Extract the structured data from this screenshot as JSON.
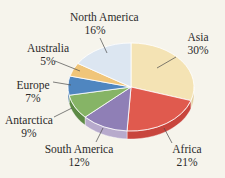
{
  "chart_data": {
    "type": "pie",
    "title": "",
    "style": "3d-tilted",
    "start_angle_deg": 0,
    "direction": "clockwise",
    "slices": [
      {
        "label": "Asia",
        "value": 30,
        "pct_text": "30%",
        "color": "#f4e3b4",
        "side": "#e2cf9c"
      },
      {
        "label": "Africa",
        "value": 21,
        "pct_text": "21%",
        "color": "#e05a4e",
        "side": "#c8453d"
      },
      {
        "label": "South America",
        "value": 12,
        "pct_text": "12%",
        "color": "#8f7fb6",
        "side": "#b7aacc"
      },
      {
        "label": "Antarctica",
        "value": 9,
        "pct_text": "9%",
        "color": "#86b466",
        "side": "#5d8a45"
      },
      {
        "label": "Europe",
        "value": 7,
        "pct_text": "7%",
        "color": "#4f86c0",
        "side": "#3c6d9c"
      },
      {
        "label": "Australia",
        "value": 5,
        "pct_text": "5%",
        "color": "#f0c579",
        "side": "#d9ad60"
      },
      {
        "label": "North America",
        "value": 16,
        "pct_text": "16%",
        "color": "#dce6f1",
        "side": "#c7d3e2"
      }
    ],
    "legend": "none (callout labels)"
  },
  "labels": [
    {
      "name": "Asia",
      "pct": "30%",
      "x": 186,
      "y": 31,
      "lx1": 176,
      "ly1": 57,
      "lx2": 157,
      "ly2": 68
    },
    {
      "name": "Africa",
      "pct": "21%",
      "x": 175,
      "y": 143,
      "lx1": 172,
      "ly1": 143,
      "lx2": 164,
      "ly2": 128
    },
    {
      "name": "South America",
      "pct": "12%",
      "x": 78,
      "y": 143,
      "lx1": 96,
      "ly1": 142,
      "lx2": 103,
      "ly2": 128
    },
    {
      "name": "Antarctica",
      "pct": "9%",
      "x": 25,
      "y": 113,
      "lx1": 54,
      "ly1": 117,
      "lx2": 72,
      "ly2": 108
    },
    {
      "name": "Europe",
      "pct": "7%",
      "x": 33,
      "y": 79,
      "lx1": 53,
      "ly1": 82,
      "lx2": 71,
      "ly2": 85
    },
    {
      "name": "Australia",
      "pct": "5%",
      "x": 48,
      "y": 42,
      "lx1": 55,
      "ly1": 61,
      "lx2": 80,
      "ly2": 71
    },
    {
      "name": "North America",
      "pct": "16%",
      "x": 93,
      "y": 11,
      "lx1": 100,
      "ly1": 38,
      "lx2": 107,
      "ly2": 53
    }
  ]
}
